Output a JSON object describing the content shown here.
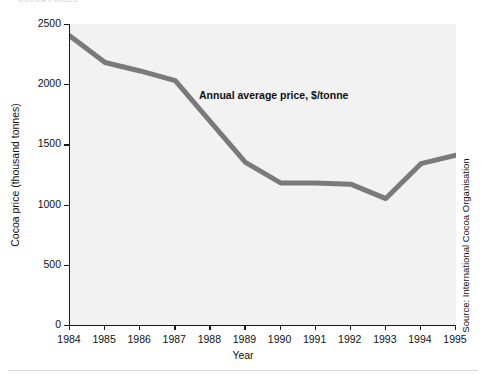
{
  "page": {
    "top_cropped_text": "COCOA PRICES",
    "background_color": "#ffffff"
  },
  "chart_data": {
    "type": "line",
    "title": "",
    "xlabel": "Year",
    "ylabel": "Cocoa price (thousand tonnes)",
    "xlim": [
      1984,
      1995
    ],
    "ylim": [
      0,
      2500
    ],
    "grid": false,
    "legend": "none",
    "plot_background_color": "#f2f2f2",
    "line_color": "#7a7a7a",
    "axis_color": "#1a1a1a",
    "categories": [
      1984,
      1985,
      1986,
      1987,
      1988,
      1989,
      1990,
      1991,
      1992,
      1993,
      1994,
      1995
    ],
    "x_tick_labels": [
      "1984",
      "1985",
      "1986",
      "1987",
      "1988",
      "1989",
      "1990",
      "1991",
      "1992",
      "1993",
      "1994",
      "1995"
    ],
    "y_tick_labels": [
      "0",
      "500",
      "1000",
      "1500",
      "2000",
      "2500"
    ],
    "y_ticks": [
      0,
      500,
      1000,
      1500,
      2000,
      2500
    ],
    "series": [
      {
        "name": "Annual average price, $/tonne",
        "values": [
          2400,
          2180,
          2110,
          2030,
          1690,
          1350,
          1180,
          1180,
          1170,
          1050,
          1340,
          1410
        ]
      }
    ],
    "annotations": [
      {
        "text": "Annual average price, $/tonne",
        "x": 1987.7,
        "y": 1800
      }
    ],
    "source": "Source: International Cocoa Organisation"
  }
}
